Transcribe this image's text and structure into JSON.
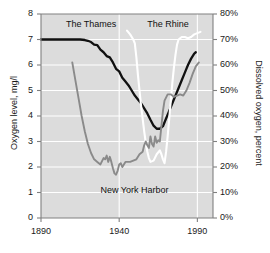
{
  "chart_data": {
    "type": "line",
    "title": "",
    "xlabel": "",
    "ylabel": "Oxygen level, mg/l",
    "ylabel_right": "Dissolved oxygen, percent",
    "xlim": [
      1890,
      2000
    ],
    "ylim": [
      0,
      8
    ],
    "ylim_right": [
      0,
      80
    ],
    "grid": true,
    "legend_position": "inline-annotations",
    "xticks": [
      1890,
      1940,
      1990
    ],
    "xtick_labels": [
      "1890",
      "1940",
      "1990"
    ],
    "yticks": [
      0,
      1,
      2,
      3,
      4,
      5,
      6,
      7,
      8
    ],
    "ytick_labels": [
      "0",
      "1",
      "2",
      "3",
      "4",
      "5",
      "6",
      "7",
      "8"
    ],
    "yticks_right": [
      0,
      10,
      20,
      30,
      40,
      50,
      60,
      70,
      80
    ],
    "ytick_labels_right": [
      "0%",
      "10%",
      "20%",
      "30%",
      "40%",
      "50%",
      "60%",
      "70%",
      "80%"
    ],
    "series": [
      {
        "name": "The Thames",
        "color": "#111111",
        "label_x": 1906,
        "label_y": 7.55,
        "points": [
          [
            1890,
            7.0
          ],
          [
            1895,
            7.0
          ],
          [
            1900,
            7.0
          ],
          [
            1905,
            7.0
          ],
          [
            1910,
            7.0
          ],
          [
            1915,
            7.0
          ],
          [
            1918,
            6.98
          ],
          [
            1920,
            6.95
          ],
          [
            1922,
            6.9
          ],
          [
            1924,
            6.8
          ],
          [
            1926,
            6.78
          ],
          [
            1928,
            6.6
          ],
          [
            1930,
            6.5
          ],
          [
            1932,
            6.35
          ],
          [
            1934,
            6.3
          ],
          [
            1936,
            6.1
          ],
          [
            1938,
            5.85
          ],
          [
            1940,
            5.75
          ],
          [
            1942,
            5.5
          ],
          [
            1944,
            5.35
          ],
          [
            1946,
            5.2
          ],
          [
            1948,
            5.0
          ],
          [
            1950,
            4.8
          ],
          [
            1952,
            4.65
          ],
          [
            1954,
            4.5
          ],
          [
            1956,
            4.3
          ],
          [
            1958,
            4.1
          ],
          [
            1960,
            3.85
          ],
          [
            1962,
            3.62
          ],
          [
            1964,
            3.5
          ],
          [
            1966,
            3.5
          ],
          [
            1968,
            3.6
          ],
          [
            1970,
            3.9
          ],
          [
            1972,
            4.2
          ],
          [
            1974,
            4.5
          ],
          [
            1976,
            4.8
          ],
          [
            1978,
            5.1
          ],
          [
            1980,
            5.4
          ],
          [
            1982,
            5.7
          ],
          [
            1984,
            6.0
          ],
          [
            1986,
            6.25
          ],
          [
            1988,
            6.45
          ],
          [
            1989,
            6.5
          ]
        ]
      },
      {
        "name": "The Rhine",
        "color": "#ffffff",
        "label_x": 1958,
        "label_y": 7.55,
        "points": [
          [
            1945,
            7.35
          ],
          [
            1947,
            7.2
          ],
          [
            1949,
            7.0
          ],
          [
            1950,
            6.85
          ],
          [
            1951,
            6.3
          ],
          [
            1952,
            5.6
          ],
          [
            1953,
            5.0
          ],
          [
            1954,
            4.4
          ],
          [
            1955,
            3.9
          ],
          [
            1956,
            3.4
          ],
          [
            1957,
            2.95
          ],
          [
            1958,
            2.6
          ],
          [
            1959,
            2.35
          ],
          [
            1960,
            2.2
          ],
          [
            1962,
            2.25
          ],
          [
            1964,
            2.5
          ],
          [
            1966,
            2.65
          ],
          [
            1967,
            2.5
          ],
          [
            1968,
            2.3
          ],
          [
            1969,
            2.15
          ],
          [
            1970,
            2.6
          ],
          [
            1971,
            3.2
          ],
          [
            1972,
            3.9
          ],
          [
            1973,
            4.6
          ],
          [
            1974,
            5.3
          ],
          [
            1975,
            5.9
          ],
          [
            1976,
            6.4
          ],
          [
            1977,
            6.8
          ],
          [
            1978,
            7.0
          ],
          [
            1980,
            7.1
          ],
          [
            1982,
            7.1
          ],
          [
            1984,
            7.05
          ],
          [
            1986,
            7.1
          ],
          [
            1988,
            7.2
          ],
          [
            1990,
            7.25
          ],
          [
            1992,
            7.3
          ]
        ]
      },
      {
        "name": "New York Harbor",
        "color": "#8a8a8a",
        "label_x": 1928,
        "label_y": 1.05,
        "points": [
          [
            1910,
            6.1
          ],
          [
            1912,
            5.4
          ],
          [
            1914,
            4.7
          ],
          [
            1916,
            4.0
          ],
          [
            1918,
            3.4
          ],
          [
            1920,
            2.9
          ],
          [
            1922,
            2.55
          ],
          [
            1924,
            2.3
          ],
          [
            1926,
            2.2
          ],
          [
            1928,
            2.1
          ],
          [
            1930,
            2.35
          ],
          [
            1931,
            2.3
          ],
          [
            1932,
            2.45
          ],
          [
            1933,
            2.2
          ],
          [
            1934,
            2.4
          ],
          [
            1935,
            2.2
          ],
          [
            1936,
            1.95
          ],
          [
            1937,
            1.75
          ],
          [
            1938,
            1.7
          ],
          [
            1939,
            1.85
          ],
          [
            1940,
            2.1
          ],
          [
            1941,
            2.15
          ],
          [
            1942,
            2.0
          ],
          [
            1943,
            2.1
          ],
          [
            1944,
            2.2
          ],
          [
            1945,
            2.2
          ],
          [
            1947,
            2.2
          ],
          [
            1949,
            2.25
          ],
          [
            1951,
            2.3
          ],
          [
            1953,
            2.5
          ],
          [
            1955,
            2.6
          ],
          [
            1956,
            2.85
          ],
          [
            1957,
            3.0
          ],
          [
            1958,
            2.85
          ],
          [
            1959,
            2.75
          ],
          [
            1960,
            3.2
          ],
          [
            1961,
            2.9
          ],
          [
            1962,
            2.8
          ],
          [
            1963,
            3.2
          ],
          [
            1964,
            2.95
          ],
          [
            1965,
            3.05
          ],
          [
            1966,
            3.0
          ],
          [
            1967,
            3.6
          ],
          [
            1968,
            4.2
          ],
          [
            1969,
            4.6
          ],
          [
            1971,
            4.85
          ],
          [
            1973,
            4.85
          ],
          [
            1975,
            4.75
          ],
          [
            1977,
            4.8
          ],
          [
            1979,
            4.85
          ],
          [
            1981,
            4.8
          ],
          [
            1983,
            5.0
          ],
          [
            1985,
            5.3
          ],
          [
            1987,
            5.65
          ],
          [
            1989,
            5.95
          ],
          [
            1991,
            6.1
          ]
        ]
      }
    ]
  },
  "axes": {
    "left_title": "Oxygen level, mg/l",
    "right_title": "Dissolved oxygen, percent",
    "plot_bg_color": "#dcdcdc",
    "grid_color": "#ffffff",
    "frame_color": "#808080"
  }
}
